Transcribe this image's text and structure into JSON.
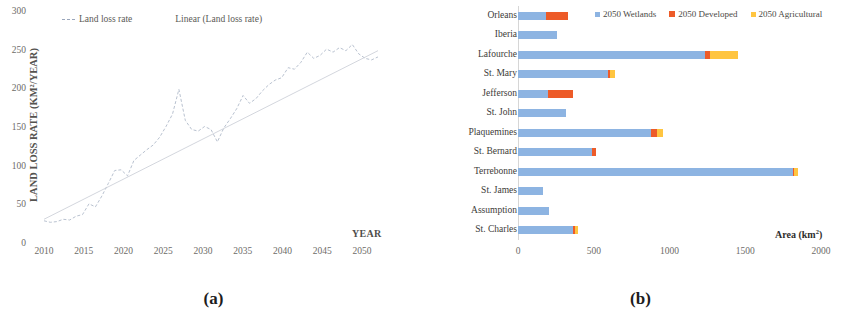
{
  "figure": {
    "panel_a_caption": "(a)",
    "panel_b_caption": "(b)"
  },
  "chart_data": [
    {
      "type": "line",
      "panel": "(a)",
      "title": "",
      "xlabel": "YEAR",
      "ylabel": "LAND LOSS RATE (KM²/YEAR)",
      "xlim": [
        2010,
        2052
      ],
      "ylim": [
        0,
        300
      ],
      "xticks": [
        "2010",
        "2015",
        "2020",
        "2025",
        "2030",
        "2035",
        "2040",
        "2045",
        "2050"
      ],
      "xtick_values": [
        2010,
        2015,
        2020,
        2025,
        2030,
        2035,
        2040,
        2045,
        2050
      ],
      "yticks": [
        "0",
        "50",
        "100",
        "150",
        "200",
        "250",
        "300"
      ],
      "ytick_values": [
        0,
        50,
        100,
        150,
        200,
        250,
        300
      ],
      "grid": false,
      "legend_position": "top-left",
      "legend": [
        "Land loss rate",
        "Linear (Land loss rate)"
      ],
      "series": [
        {
          "name": "Land loss rate",
          "style": "dashed-line",
          "color": "#b9c2d0",
          "x": [
            2010,
            2011,
            2012,
            2013,
            2014,
            2015,
            2016,
            2017,
            2018,
            2019,
            2020,
            2021,
            2022,
            2023,
            2024,
            2025,
            2026,
            2027,
            2028,
            2029,
            2030,
            2031,
            2032,
            2033,
            2034,
            2035,
            2036,
            2037,
            2038,
            2039,
            2040,
            2041,
            2042,
            2043,
            2044,
            2045,
            2046,
            2047,
            2048,
            2049,
            2050,
            2051,
            2052
          ],
          "values": [
            30,
            28,
            29,
            32,
            31,
            36,
            38,
            52,
            48,
            62,
            78,
            95,
            96,
            88,
            108,
            115,
            122,
            128,
            138,
            152,
            168,
            200,
            160,
            148,
            146,
            152,
            148,
            132,
            150,
            162,
            175,
            192,
            182,
            188,
            198,
            206,
            212,
            215,
            228,
            226,
            235,
            248,
            240,
            244,
            252,
            248,
            254,
            250,
            258,
            246,
            240,
            238,
            242
          ]
        },
        {
          "name": "Linear (Land loss rate)",
          "style": "solid-trend",
          "color": "#c8ccd4",
          "x": [
            2010,
            2052
          ],
          "values": [
            32,
            250
          ]
        }
      ]
    },
    {
      "type": "bar",
      "orientation": "horizontal",
      "stacked": true,
      "panel": "(b)",
      "title": "",
      "xlabel": "Area (km²)",
      "ylabel": "",
      "xlim": [
        0,
        2000
      ],
      "xticks": [
        "0",
        "500",
        "1000",
        "1500",
        "2000"
      ],
      "xtick_values": [
        0,
        500,
        1000,
        1500,
        2000
      ],
      "grid": false,
      "legend_position": "top-right",
      "categories": [
        "Orleans",
        "Iberia",
        "Lafourche",
        "St. Mary",
        "Jefferson",
        "St. John",
        "Plaquemines",
        "St. Bernard",
        "Terrebonne",
        "St. James",
        "Assumption",
        "St. Charles"
      ],
      "series": [
        {
          "name": "2050 Wetlands",
          "color": "#8db4e2",
          "values": [
            185,
            255,
            1235,
            595,
            200,
            320,
            880,
            490,
            1815,
            165,
            205,
            360
          ]
        },
        {
          "name": "2050 Developed",
          "color": "#ed5b28",
          "values": [
            145,
            0,
            35,
            10,
            160,
            0,
            35,
            25,
            5,
            0,
            0,
            15
          ]
        },
        {
          "name": "2050 Agricultural",
          "color": "#ffc540",
          "values": [
            0,
            0,
            180,
            35,
            0,
            0,
            40,
            0,
            30,
            0,
            0,
            20
          ]
        }
      ]
    }
  ]
}
